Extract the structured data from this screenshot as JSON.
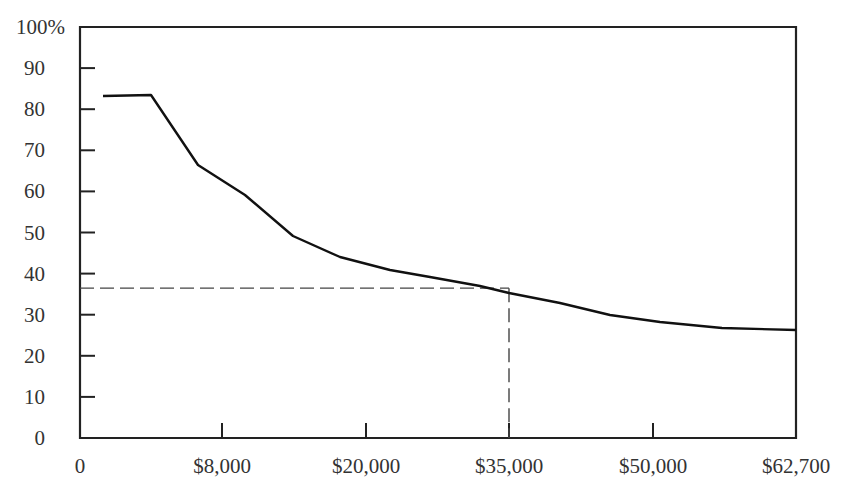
{
  "chart_data": {
    "type": "line",
    "title": "",
    "xlabel": "",
    "ylabel": "",
    "ylim": [
      0,
      100
    ],
    "grid": false,
    "legend": null,
    "y_ticks": [
      "0",
      "10",
      "20",
      "30",
      "40",
      "50",
      "60",
      "70",
      "80",
      "90",
      "100%"
    ],
    "x_ticks": [
      "0",
      "$8,000",
      "$20,000",
      "$35,000",
      "$50,000",
      "$62,700"
    ],
    "x_tick_positions_px": [
      80,
      222,
      366,
      509,
      653,
      796
    ],
    "series": [
      {
        "name": "curve",
        "color": "#111111",
        "points_px": [
          [
            103,
            96
          ],
          [
            151,
            95
          ],
          [
            198,
            165
          ],
          [
            245,
            195
          ],
          [
            293,
            236
          ],
          [
            340,
            257
          ],
          [
            390,
            270
          ],
          [
            430,
            277
          ],
          [
            480,
            286
          ],
          [
            509,
            293
          ],
          [
            560,
            303
          ],
          [
            610,
            315
          ],
          [
            660,
            322
          ],
          [
            722,
            328
          ],
          [
            796,
            330
          ]
        ],
        "values_pct": [
          83.2,
          83.4,
          66.4,
          59.1,
          49.1,
          44.0,
          40.9,
          39.2,
          37.0,
          35.3,
          32.8,
          29.9,
          28.2,
          26.8,
          26.3
        ]
      }
    ],
    "annotations": [
      {
        "type": "dashed-reference",
        "x_label": "$35,000",
        "y_value": 35,
        "description": "Dashed lines marking the curve at $35,000 ≈ 35%"
      }
    ]
  }
}
